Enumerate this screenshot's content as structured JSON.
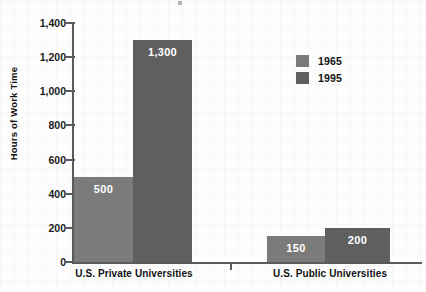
{
  "chart_data": {
    "type": "bar",
    "title": "",
    "xlabel": "",
    "ylabel": "Hours of Work Time",
    "categories": [
      "U.S. Private Universities",
      "U.S. Public Universities"
    ],
    "series": [
      {
        "name": "1965",
        "color": "#7b7b7b",
        "values": [
          500,
          150
        ]
      },
      {
        "name": "1995",
        "color": "#5f5f5f",
        "values": [
          1300,
          200
        ]
      }
    ],
    "value_labels": [
      [
        "500",
        "1,300"
      ],
      [
        "150",
        "200"
      ]
    ],
    "ylim": [
      0,
      1400
    ],
    "yticks": [
      0,
      200,
      400,
      600,
      800,
      1000,
      1200,
      1400
    ],
    "ytick_labels": [
      "0",
      "200",
      "400",
      "600",
      "800",
      "1,000",
      "1,200",
      "1,400"
    ],
    "grid": false,
    "legend_position": "upper-right"
  },
  "axis": {
    "y_title": "Hours of Work Time",
    "ticks": [
      {
        "label": "1,400",
        "value": 1400
      },
      {
        "label": "1,200",
        "value": 1200
      },
      {
        "label": "1,000",
        "value": 1000
      },
      {
        "label": "800",
        "value": 800
      },
      {
        "label": "600",
        "value": 600
      },
      {
        "label": "400",
        "value": 400
      },
      {
        "label": "200",
        "value": 200
      },
      {
        "label": "0",
        "value": 0
      }
    ]
  },
  "groups": [
    {
      "label": "U.S. Private Universities",
      "bars": [
        {
          "series": "1965",
          "value": 500,
          "label": "500",
          "color": "#7b7b7b"
        },
        {
          "series": "1995",
          "value": 1300,
          "label": "1,300",
          "color": "#5f5f5f"
        }
      ]
    },
    {
      "label": "U.S. Public Universities",
      "bars": [
        {
          "series": "1965",
          "value": 150,
          "label": "150",
          "color": "#7b7b7b"
        },
        {
          "series": "1995",
          "value": 200,
          "label": "200",
          "color": "#5f5f5f"
        }
      ]
    }
  ],
  "legend": {
    "items": [
      {
        "label": "1965",
        "color": "#7b7b7b"
      },
      {
        "label": "1995",
        "color": "#5f5f5f"
      }
    ]
  }
}
